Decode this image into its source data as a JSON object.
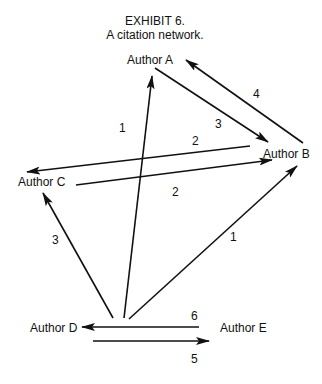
{
  "title": {
    "line1": "EXHIBIT 6.",
    "line2": "A citation network."
  },
  "nodes": {
    "a": "Author A",
    "b": "Author B",
    "c": "Author C",
    "d": "Author D",
    "e": "Author E"
  },
  "edges": [
    {
      "from": "Author D",
      "to": "Author A",
      "weight": "1"
    },
    {
      "from": "Author A",
      "to": "Author B",
      "weight": "3"
    },
    {
      "from": "Author B",
      "to": "Author A",
      "weight": "4"
    },
    {
      "from": "Author B",
      "to": "Author C",
      "weight": "2"
    },
    {
      "from": "Author C",
      "to": "Author B",
      "weight": "2"
    },
    {
      "from": "Author D",
      "to": "Author C",
      "weight": "3"
    },
    {
      "from": "Author D",
      "to": "Author B",
      "weight": "1"
    },
    {
      "from": "Author E",
      "to": "Author D",
      "weight": "6"
    },
    {
      "from": "Author D",
      "to": "Author E",
      "weight": "5"
    }
  ]
}
